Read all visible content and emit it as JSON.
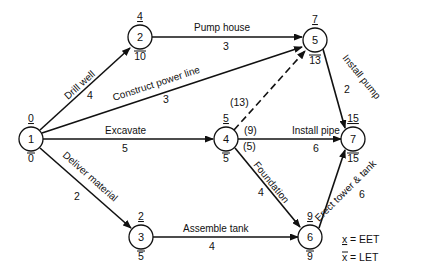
{
  "diagram": {
    "type": "activity-network",
    "nodes": [
      {
        "id": "1",
        "eet": "0",
        "let": "0"
      },
      {
        "id": "2",
        "eet": "4",
        "let": "10"
      },
      {
        "id": "3",
        "eet": "2",
        "let": "5"
      },
      {
        "id": "4",
        "eet": "5",
        "let": "5"
      },
      {
        "id": "5",
        "eet": "7",
        "let": "13"
      },
      {
        "id": "6",
        "eet": "9",
        "let": "9"
      },
      {
        "id": "7",
        "eet": "15",
        "let": "15"
      }
    ],
    "edges": [
      {
        "from": "1",
        "to": "2",
        "activity": "Drill well",
        "duration": "4"
      },
      {
        "from": "1",
        "to": "5",
        "activity": "Construct power line",
        "duration": "3"
      },
      {
        "from": "1",
        "to": "4",
        "activity": "Excavate",
        "duration": "5"
      },
      {
        "from": "1",
        "to": "3",
        "activity": "Deliver material",
        "duration": "2"
      },
      {
        "from": "2",
        "to": "5",
        "activity": "Pump house",
        "duration": "3"
      },
      {
        "from": "4",
        "to": "5",
        "activity": "",
        "duration": "",
        "dummy": true,
        "note": "(13)"
      },
      {
        "from": "4",
        "to": "7",
        "activity": "Install pipe",
        "duration": "6",
        "note": "(9)"
      },
      {
        "from": "4",
        "to": "6",
        "activity": "Foundation",
        "duration": "4",
        "note": "(5)"
      },
      {
        "from": "5",
        "to": "7",
        "activity": "Install pump",
        "duration": "2"
      },
      {
        "from": "3",
        "to": "6",
        "activity": "Assemble tank",
        "duration": "4"
      },
      {
        "from": "6",
        "to": "7",
        "activity": "Erect tower & tank",
        "duration": "6"
      }
    ],
    "legend": [
      {
        "symbol": "x",
        "mark": "underline",
        "meaning": "= EET"
      },
      {
        "symbol": "x",
        "mark": "overline",
        "meaning": "= LET"
      }
    ]
  }
}
